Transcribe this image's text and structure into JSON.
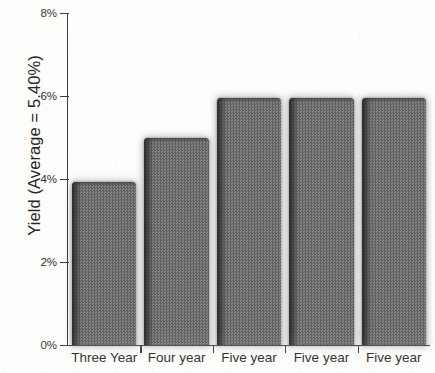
{
  "chart_data": {
    "type": "bar",
    "title": "",
    "subtitle": "",
    "xlabel": "",
    "ylabel": "Yield (Average = 5.40%)",
    "categories": [
      "Three Year",
      "Four year",
      "Five year",
      "Five year",
      "Five year"
    ],
    "values": [
      3.93,
      5.0,
      5.95,
      5.95,
      5.95
    ],
    "value_labels": [
      "",
      "",
      "",
      "",
      ""
    ],
    "ylim": [
      0,
      8
    ],
    "y_ticks": [
      0,
      2,
      4,
      6,
      8
    ],
    "y_tick_labels": [
      "0%",
      "2%",
      "4%",
      "6%",
      "8%"
    ],
    "grid": false,
    "legend": null,
    "legend_position": "none",
    "annotations": [],
    "series": [
      {
        "name": "Yield",
        "values": [
          3.93,
          5.0,
          5.95,
          5.95,
          5.95
        ]
      }
    ],
    "average": 5.4,
    "average_label": "Average = 5.40%",
    "colors": {
      "bar_fill": "#6f6f6f",
      "bar_shade": "#2d2d2d",
      "axis": "#3a3a3a",
      "text": "#262626",
      "background": "#fdfdfb"
    }
  },
  "axis": {
    "y_title": "Yield (Average = 5.40%)",
    "ticks": [
      {
        "label": "8%",
        "value": 8
      },
      {
        "label": "6%",
        "value": 6
      },
      {
        "label": "4%",
        "value": 4
      },
      {
        "label": "2%",
        "value": 2
      },
      {
        "label": "0%",
        "value": 0
      }
    ]
  },
  "bars": [
    {
      "label": "Three Year",
      "value": 3.93
    },
    {
      "label": "Four year",
      "value": 5.0
    },
    {
      "label": "Five year",
      "value": 5.95
    },
    {
      "label": "Five year",
      "value": 5.95
    },
    {
      "label": "Five year",
      "value": 5.95
    }
  ]
}
